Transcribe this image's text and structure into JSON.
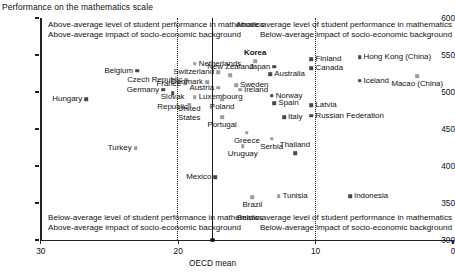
{
  "title": "Performance on the mathematics scale",
  "axes": {
    "y": {
      "label": "Performance on the mathematics scale",
      "ticks": [
        600,
        550,
        500,
        450,
        400,
        350,
        300
      ],
      "min": 300,
      "max": 600
    },
    "x": {
      "ticks": [
        30,
        20,
        10,
        0
      ],
      "min": 0,
      "max": 30,
      "reversed": true,
      "oecd_mean_label": "OECD mean",
      "oecd_mean_value": 17.5
    }
  },
  "quadrant_notes": {
    "top_left_line1": "Above-average level of student performance in mathematics",
    "top_left_line2": "Above-average impact of socio-economic background",
    "top_right_line1": "Above-average level of student performance in mathematics",
    "top_right_line2": "Below-average impact of socio-economic background",
    "bottom_left_line1": "Below-average level of student performance in mathematics",
    "bottom_left_line2": "Above-average impact of socio-economic background",
    "bottom_right_line1": "Below-average level of student performance in mathematics",
    "bottom_right_line2": "Below-average impact of socio-economic background"
  },
  "colors": {
    "dark_marker": "#474747",
    "light_marker": "#9c9c9c",
    "axis": "#222222",
    "divider": "#1b1b1b",
    "background": "#ffffff"
  },
  "chart_data": {
    "type": "scatter",
    "title": "Performance on the mathematics scale",
    "xlabel": "Percentage of variance in performance explained by socio-economic background",
    "ylabel": "Performance on the mathematics scale",
    "xlim": [
      30,
      0
    ],
    "ylim": [
      300,
      600
    ],
    "grid": false,
    "legend": "none",
    "reference_lines": [
      {
        "name": "dotted-left",
        "x": 20,
        "style": "dotted"
      },
      {
        "name": "oecd-mean",
        "x": 17.5,
        "style": "solid"
      },
      {
        "name": "dotted-right",
        "x": 10,
        "style": "dotted"
      }
    ],
    "points": [
      {
        "name": "Hungary",
        "x": 26.7,
        "y": 490,
        "marker": "dark",
        "lpos": "r",
        "bold": false
      },
      {
        "name": "Belgium",
        "x": 23.0,
        "y": 529,
        "marker": "dark",
        "lpos": "r",
        "bold": false
      },
      {
        "name": "Germany",
        "x": 21.1,
        "y": 503,
        "marker": "dark",
        "lpos": "r",
        "bold": false
      },
      {
        "name": "Slovak Republic",
        "x": 20.4,
        "y": 498,
        "marker": "dark",
        "lpos": "cb",
        "bold": false
      },
      {
        "name": "Turkey",
        "x": 23.1,
        "y": 424,
        "marker": "light",
        "lpos": "r",
        "bold": false
      },
      {
        "name": "Czech Republic",
        "x": 19.4,
        "y": 516,
        "marker": "light",
        "lpos": "r",
        "bold": false
      },
      {
        "name": "France",
        "x": 19.5,
        "y": 511,
        "marker": "light",
        "lpos": "r",
        "bold": false
      },
      {
        "name": "Netherlands",
        "x": 18.8,
        "y": 538,
        "marker": "light",
        "lpos": "l",
        "bold": false
      },
      {
        "name": "Denmark",
        "x": 17.9,
        "y": 513,
        "marker": "light",
        "lpos": "r",
        "bold": false
      },
      {
        "name": "Switzerland",
        "x": 17.1,
        "y": 527,
        "marker": "light",
        "lpos": "r",
        "bold": false
      },
      {
        "name": "Austria",
        "x": 17.1,
        "y": 506,
        "marker": "light",
        "lpos": "r",
        "bold": false
      },
      {
        "name": "Luxembourg",
        "x": 18.8,
        "y": 493,
        "marker": "light",
        "lpos": "l",
        "bold": false
      },
      {
        "name": "United States",
        "x": 19.2,
        "y": 483,
        "marker": "light",
        "lpos": "cb",
        "bold": false
      },
      {
        "name": "Poland",
        "x": 16.8,
        "y": 490,
        "marker": "light",
        "lpos": "cb",
        "bold": false
      },
      {
        "name": "Portugal",
        "x": 16.8,
        "y": 466,
        "marker": "light",
        "lpos": "cb",
        "bold": false
      },
      {
        "name": "New Zealand",
        "x": 16.2,
        "y": 523,
        "marker": "light",
        "lpos": "c",
        "bold": false
      },
      {
        "name": "Sweden",
        "x": 15.8,
        "y": 509,
        "marker": "light",
        "lpos": "l",
        "bold": false
      },
      {
        "name": "Ireland",
        "x": 15.5,
        "y": 503,
        "marker": "light",
        "lpos": "l",
        "bold": false
      },
      {
        "name": "Korea",
        "x": 14.4,
        "y": 542,
        "marker": "light",
        "lpos": "ct",
        "bold": true
      },
      {
        "name": "Australia",
        "x": 13.3,
        "y": 524,
        "marker": "dark",
        "lpos": "l",
        "bold": false
      },
      {
        "name": "Japan",
        "x": 13.0,
        "y": 534,
        "marker": "dark",
        "lpos": "r",
        "bold": false
      },
      {
        "name": "Norway",
        "x": 13.2,
        "y": 495,
        "marker": "dark",
        "lpos": "l",
        "bold": false
      },
      {
        "name": "Spain",
        "x": 13.0,
        "y": 485,
        "marker": "dark",
        "lpos": "l",
        "bold": false
      },
      {
        "name": "Italy",
        "x": 12.3,
        "y": 466,
        "marker": "dark",
        "lpos": "l",
        "bold": false
      },
      {
        "name": "Greece",
        "x": 15.0,
        "y": 445,
        "marker": "light",
        "lpos": "cb",
        "bold": false
      },
      {
        "name": "Uruguay",
        "x": 15.3,
        "y": 427,
        "marker": "light",
        "lpos": "cb",
        "bold": false
      },
      {
        "name": "Serbia",
        "x": 13.2,
        "y": 437,
        "marker": "light",
        "lpos": "cb",
        "bold": false
      },
      {
        "name": "Thailand",
        "x": 11.5,
        "y": 417,
        "marker": "dark",
        "lpos": "ct",
        "bold": false
      },
      {
        "name": "Mexico",
        "x": 17.3,
        "y": 385,
        "marker": "dark",
        "lpos": "r",
        "bold": false
      },
      {
        "name": "Brazil",
        "x": 14.6,
        "y": 358,
        "marker": "light",
        "lpos": "cb",
        "bold": false
      },
      {
        "name": "Tunisia",
        "x": 12.7,
        "y": 359,
        "marker": "light",
        "lpos": "l",
        "bold": false
      },
      {
        "name": "Finland",
        "x": 10.3,
        "y": 544,
        "marker": "dark",
        "lpos": "l",
        "bold": false
      },
      {
        "name": "Canada",
        "x": 10.3,
        "y": 532,
        "marker": "dark",
        "lpos": "l",
        "bold": false
      },
      {
        "name": "Latvia",
        "x": 10.3,
        "y": 482,
        "marker": "dark",
        "lpos": "l",
        "bold": false
      },
      {
        "name": "Russian Federation",
        "x": 10.3,
        "y": 468,
        "marker": "dark",
        "lpos": "l",
        "bold": false
      },
      {
        "name": "Hong Kong (China)",
        "x": 6.8,
        "y": 547,
        "marker": "dark",
        "lpos": "l",
        "bold": false
      },
      {
        "name": "Iceland",
        "x": 6.8,
        "y": 515,
        "marker": "dark",
        "lpos": "l",
        "bold": false
      },
      {
        "name": "Macao (China)",
        "x": 2.6,
        "y": 521,
        "marker": "light",
        "lpos": "cb",
        "bold": false
      },
      {
        "name": "Indonesia",
        "x": 7.5,
        "y": 359,
        "marker": "dark",
        "lpos": "l",
        "bold": false
      }
    ]
  }
}
